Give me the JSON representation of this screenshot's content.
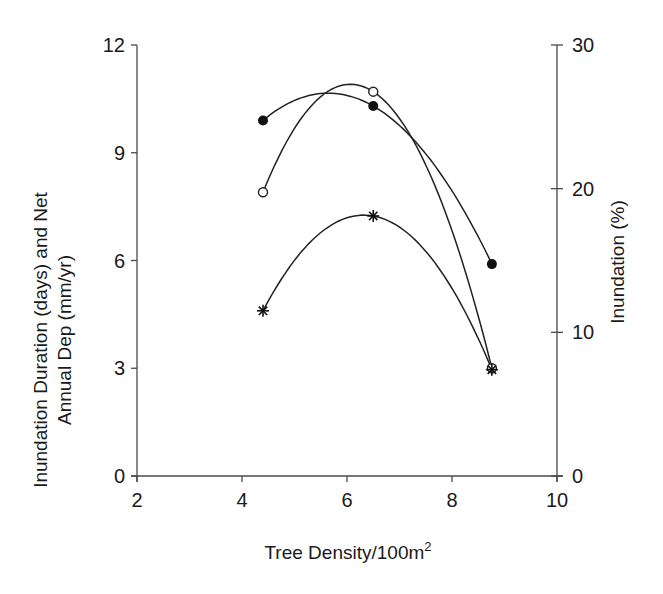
{
  "chart_data": {
    "type": "line",
    "title": "",
    "xlabel": "Tree Density/100m",
    "xlabel_superscript": "2",
    "ylabel_lines": [
      "Inundation Duration (days) and Net",
      "Annual Dep (mm/yr)"
    ],
    "ylabel_right": "Inundation (%)",
    "xlim": [
      2,
      10
    ],
    "ylim": [
      0,
      12
    ],
    "ylim_right": [
      0,
      30
    ],
    "x_ticks": [
      2,
      4,
      6,
      8,
      10
    ],
    "y_ticks": [
      0,
      3,
      6,
      9,
      12
    ],
    "y_right_ticks": [
      0,
      10,
      20,
      30
    ],
    "grid": false,
    "legend": "none",
    "curve_fit": "quadratic (smoothed trend through points)",
    "x": [
      4.4,
      6.5,
      8.76
    ],
    "series": [
      {
        "name": "Net Annual Deposition (mm/yr)",
        "marker": "filled-circle",
        "axis": "left",
        "values": [
          9.9,
          10.3,
          5.9
        ]
      },
      {
        "name": "Inundation Duration (days)",
        "marker": "open-circle",
        "axis": "left",
        "values": [
          7.9,
          10.7,
          3.0
        ]
      },
      {
        "name": "Inundation (%)",
        "marker": "star",
        "axis": "right",
        "values": [
          11.5,
          18.1,
          7.4
        ]
      }
    ]
  },
  "colors": {
    "line": "#222222",
    "axis": "#4a4a4a",
    "text": "#1a1a1a",
    "background": "#ffffff"
  }
}
